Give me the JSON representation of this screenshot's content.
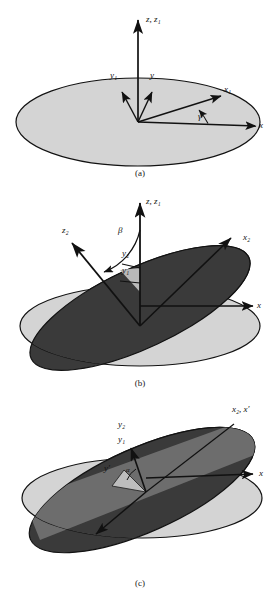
{
  "figure": {
    "type": "euler-angle-rotation-diagram",
    "panels": [
      {
        "id": "a",
        "caption": "(a)",
        "description": "Single horizontal plane with original axes x, y, z and once-rotated axes x1, y1, z1 separated by angle gamma about z.",
        "labels": [
          {
            "name": "z-z1",
            "text": "z, z₁"
          },
          {
            "name": "y1",
            "text": "y₁"
          },
          {
            "name": "y",
            "text": "y"
          },
          {
            "name": "x1",
            "text": "x₁"
          },
          {
            "name": "x",
            "text": "x"
          },
          {
            "name": "gamma",
            "text": "γ"
          }
        ]
      },
      {
        "id": "b",
        "caption": "(b)",
        "description": "Light horizontal plane and dark tilted plane intersecting; axes z2 and z,z1 separated by angle beta, with y2, y1, x2 and x marked.",
        "labels": [
          {
            "name": "z-z1",
            "text": "z, z₁"
          },
          {
            "name": "z2",
            "text": "z₂"
          },
          {
            "name": "beta",
            "text": "β"
          },
          {
            "name": "y2",
            "text": "y₂"
          },
          {
            "name": "y1",
            "text": "y₁"
          },
          {
            "name": "x2",
            "text": "x₂"
          },
          {
            "name": "x",
            "text": "x"
          }
        ]
      },
      {
        "id": "c",
        "caption": "(c)",
        "description": "Light horizontal plane and dark tilted disk with a mid-gray band; axes y2, y1 and y-prime separated by angle alpha, with x2, x-prime and x marked.",
        "labels": [
          {
            "name": "y2",
            "text": "y₂"
          },
          {
            "name": "y1",
            "text": "y₁"
          },
          {
            "name": "y-prime",
            "text": "y′"
          },
          {
            "name": "alpha",
            "text": "α"
          },
          {
            "name": "x2-xprime",
            "text": "x₂, x′"
          },
          {
            "name": "x",
            "text": "x"
          }
        ]
      }
    ],
    "colors": {
      "plane_light": "#d4d4d4",
      "plane_light_edge": "#121212",
      "plane_dark": "#3a3a3a",
      "plane_mid": "#8e8e8e",
      "plane_mid_dark": "#5d5d5d",
      "arrow": "#111111",
      "background": "#ffffff",
      "text": "#111111"
    }
  }
}
